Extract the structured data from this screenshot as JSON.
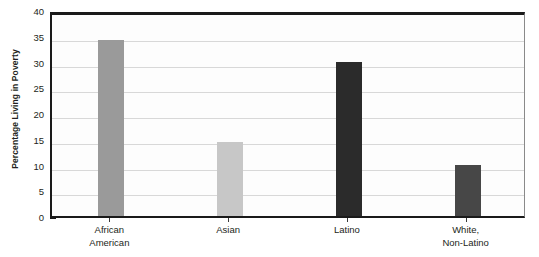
{
  "chart_data": {
    "type": "bar",
    "title": "",
    "xlabel": "",
    "ylabel": "Percentage Living in Poverty",
    "categories": [
      "African American",
      "Asian",
      "Latino",
      "White, Non-Latino"
    ],
    "category_lines": [
      [
        "African",
        "American"
      ],
      [
        "Asian"
      ],
      [
        "Latino"
      ],
      [
        "White,",
        "Non-Latino"
      ]
    ],
    "values": [
      34.2,
      14.3,
      30.0,
      10.0
    ],
    "bar_colors": [
      "#9a9a9a",
      "#c7c7c7",
      "#2b2b2b",
      "#474747"
    ],
    "ylim": [
      0,
      40
    ],
    "ytick_values": [
      0,
      5,
      10,
      15,
      20,
      25,
      30,
      35,
      40
    ],
    "ytick_labels": [
      "0",
      "5",
      "10",
      "15",
      "20",
      "25",
      "30",
      "35",
      "40"
    ],
    "grid": true,
    "grid_axis": "y",
    "legend": false,
    "legend_position": "none",
    "plot_background": "#fdfdfd",
    "gridline_color": "#d8d8d8",
    "axis_color": "#1a1a1a",
    "text_color": "#231f20"
  }
}
